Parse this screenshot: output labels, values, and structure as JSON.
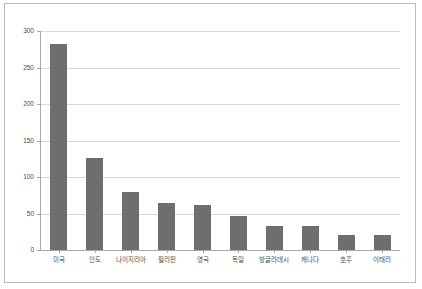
{
  "chart_data": {
    "type": "bar",
    "title": "",
    "subtitle": "",
    "xlabel": "",
    "ylabel": "",
    "categories": [
      "미국",
      "인도",
      "나이지리아",
      "필리핀",
      "영국",
      "독일",
      "방글라데시",
      "캐나다",
      "호주",
      "이태리"
    ],
    "values": [
      282,
      126,
      80,
      65,
      61,
      47,
      33,
      33,
      20,
      20
    ],
    "series": [
      {
        "name": "",
        "values": [
          282,
          126,
          80,
          65,
          61,
          47,
          33,
          33,
          20,
          20
        ]
      }
    ],
    "ylim": [
      0,
      300
    ],
    "yticks": [
      0,
      50,
      100,
      150,
      200,
      250,
      300
    ],
    "ytick_labels": [
      "0",
      "50",
      "100",
      "150",
      "200",
      "250",
      "300"
    ],
    "grid": true,
    "legend": "none",
    "bar_color": "#6e6e6e",
    "gridline_color": "#d9d9d9",
    "axis_color": "#a8a8a8",
    "frame_color": "#b9b9b9",
    "background_color": "#ffffff",
    "text_color": "#4a4a4a"
  }
}
